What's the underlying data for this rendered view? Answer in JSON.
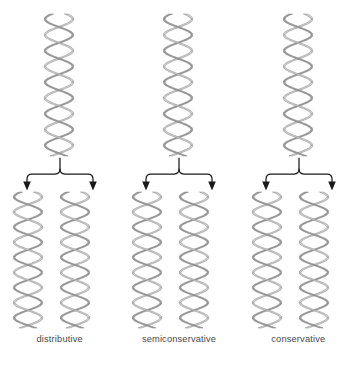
{
  "figure": {
    "background_color": "#ffffff",
    "width": 358,
    "height": 370
  },
  "style": {
    "strand_light_color": "#cfcfcf",
    "strand_dark_color": "#9a9a9a",
    "strand_edge_color": "#7d7d7d",
    "arrow_color": "#1a1a1a",
    "label_color": "#4a4a4a"
  },
  "columns": [
    {
      "id": "distributive",
      "label": "distributive",
      "parent": {
        "strands": 2,
        "turns": 4.5
      },
      "arrow_count": 2,
      "daughters": [
        {
          "id": "distributive-daughter-left",
          "strands": 2,
          "turns": 4.5
        },
        {
          "id": "distributive-daughter-right",
          "strands": 2,
          "turns": 4.5
        }
      ]
    },
    {
      "id": "semiconservative",
      "label": "semiconservative",
      "parent": {
        "strands": 2,
        "turns": 4.5
      },
      "arrow_count": 2,
      "daughters": [
        {
          "id": "semiconservative-daughter-left",
          "strands": 2,
          "turns": 4.5
        },
        {
          "id": "semiconservative-daughter-right",
          "strands": 2,
          "turns": 4.5
        }
      ]
    },
    {
      "id": "conservative",
      "label": "conservative",
      "parent": {
        "strands": 2,
        "turns": 4.5
      },
      "arrow_count": 2,
      "daughters": [
        {
          "id": "conservative-daughter-left",
          "strands": 2,
          "turns": 4.5
        },
        {
          "id": "conservative-daughter-right",
          "strands": 2,
          "turns": 4.5
        }
      ]
    }
  ]
}
